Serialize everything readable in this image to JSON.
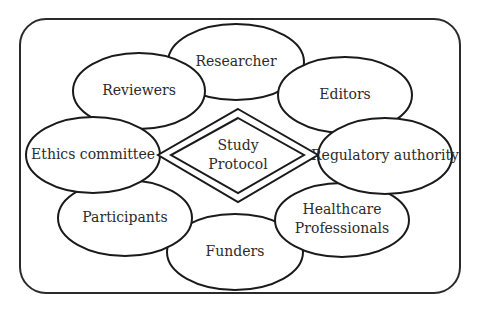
{
  "diagram": {
    "type": "stakeholder-map",
    "center": {
      "label_lines": [
        "Study",
        "Protocol"
      ],
      "shape": "double-diamond"
    },
    "nodes": [
      {
        "id": "researcher",
        "label_lines": [
          "Researcher"
        ]
      },
      {
        "id": "reviewers",
        "label_lines": [
          "Reviewers"
        ]
      },
      {
        "id": "editors",
        "label_lines": [
          "Editors"
        ]
      },
      {
        "id": "ethics-committee",
        "label_lines": [
          "Ethics committee"
        ]
      },
      {
        "id": "regulatory-authority",
        "label_lines": [
          "Regulatory authority"
        ]
      },
      {
        "id": "participants",
        "label_lines": [
          "Participants"
        ]
      },
      {
        "id": "healthcare-professionals",
        "label_lines": [
          "Healthcare",
          "Professionals"
        ]
      },
      {
        "id": "funders",
        "label_lines": [
          "Funders"
        ]
      }
    ],
    "colors": {
      "stroke": "#1a1a1a",
      "fill": "#ffffff",
      "text": "#2b2b2b"
    }
  }
}
